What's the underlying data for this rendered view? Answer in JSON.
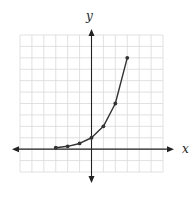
{
  "chart_data": {
    "type": "line",
    "title": "",
    "xlabel": "x",
    "ylabel": "y",
    "xlim": [
      -6,
      6
    ],
    "ylim": [
      -2,
      10
    ],
    "grid": true,
    "grid_step": 1,
    "tick_labels": false,
    "legend": null,
    "series": [
      {
        "name": "y = 2^x",
        "markers": true,
        "x": [
          -3,
          -2,
          -1,
          0,
          1,
          2,
          3
        ],
        "y": [
          0.125,
          0.25,
          0.5,
          1,
          2,
          4,
          8
        ]
      }
    ]
  },
  "colors": {
    "grid": "#d9d9d9",
    "axis": "#222222",
    "curve": "#333333",
    "background": "#ffffff"
  }
}
